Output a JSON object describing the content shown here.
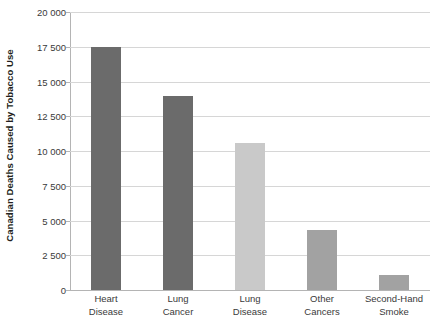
{
  "chart_data": {
    "type": "bar",
    "title": "",
    "xlabel": "",
    "ylabel": "Canadian Deaths Caused by Tobacco Use",
    "categories": [
      "Heart Disease",
      "Lung Cancer",
      "Lung Disease",
      "Other Cancers",
      "Second-Hand Smoke"
    ],
    "category_lines": [
      [
        "Heart",
        "Disease"
      ],
      [
        "Lung",
        "Cancer"
      ],
      [
        "Lung",
        "Disease"
      ],
      [
        "Other",
        "Cancers"
      ],
      [
        "Second-Hand",
        "Smoke"
      ]
    ],
    "values": [
      17450,
      13950,
      10575,
      4320,
      1080
    ],
    "bar_colors": [
      "#6b6b6b",
      "#6b6b6b",
      "#c9c9c9",
      "#a2a2a2",
      "#a2a2a2"
    ],
    "ylim": [
      0,
      20000
    ],
    "ytick_values": [
      0,
      2500,
      5000,
      7500,
      10000,
      12500,
      15000,
      17500,
      20000
    ],
    "ytick_labels": [
      "0",
      "2 500",
      "5 000",
      "7 500",
      "10 000",
      "12 500",
      "15 000",
      "17 500",
      "20 000"
    ],
    "grid": true,
    "legend": "none",
    "gridline_color": "#d6d6d6",
    "axis_color": "#b4b4b4",
    "background": "#ffffff"
  }
}
